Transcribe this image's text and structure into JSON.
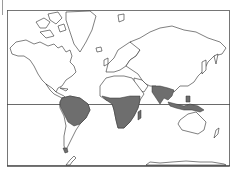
{
  "map": {
    "projection": "mercator-world",
    "frame": {
      "x": 7,
      "y": 10,
      "width": 223,
      "height": 156
    },
    "equator_y": 104,
    "colors": {
      "land_fill": "#ffffff",
      "coastline": "#2a2a2a",
      "shaded_region": "#6e6e6e",
      "frame_line": "#555555",
      "background": "#ffffff"
    },
    "shaded_regions": [
      {
        "name": "Northern South America / Amazon"
      },
      {
        "name": "Sub-Saharan Africa"
      },
      {
        "name": "South Asia / Indian subcontinent"
      },
      {
        "name": "Southeast Asia / Indonesia / New Guinea"
      },
      {
        "name": "Tierra del Fuego"
      },
      {
        "name": "Madagascar"
      }
    ]
  }
}
